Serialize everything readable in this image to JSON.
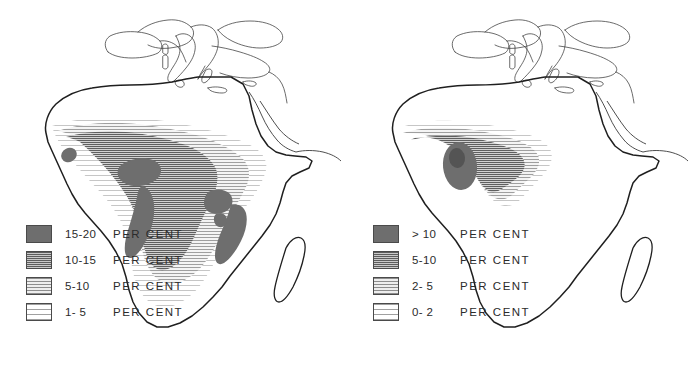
{
  "figure": {
    "type": "choropleth-map-pair",
    "region": "Africa",
    "unit_label": "PER CENT",
    "background_color": "#ffffff",
    "ink_color": "#2b2b2b"
  },
  "maps": [
    {
      "id": "left-map",
      "position": "left",
      "legend": {
        "classes": [
          {
            "range": "15-20",
            "unit": "PER CENT",
            "fill": "solid",
            "swatch_color": "#6e6e6e",
            "order": 1
          },
          {
            "range": "10-15",
            "unit": "PER CENT",
            "fill": "dense",
            "swatch_color": "#5d5d5d",
            "order": 2
          },
          {
            "range": "5-10",
            "unit": "PER CENT",
            "fill": "medium",
            "swatch_color": "#8d8d8d",
            "order": 3
          },
          {
            "range": "1- 5",
            "unit": "PER CENT",
            "fill": "sparse",
            "swatch_color": "#a0a0a0",
            "order": 4
          }
        ]
      },
      "shaded_regions": [
        "West Africa / Sahel belt",
        "Guinea coast dark core",
        "Nigeria-Cameroon coastal dark core",
        "Congo basin",
        "Angola coastal dark band",
        "Great Lakes / East Africa dark core",
        "Mozambique corridor"
      ],
      "unshaded_features": [
        "Sahara",
        "Southern Africa",
        "Horn of Africa",
        "Madagascar",
        "Southern Europe",
        "Arabia"
      ]
    },
    {
      "id": "right-map",
      "position": "right",
      "legend": {
        "classes": [
          {
            "range": "> 10",
            "unit": "PER CENT",
            "fill": "solid",
            "swatch_color": "#6e6e6e",
            "order": 1
          },
          {
            "range": "5-10",
            "unit": "PER CENT",
            "fill": "dense",
            "swatch_color": "#5d5d5d",
            "order": 2
          },
          {
            "range": "2- 5",
            "unit": "PER CENT",
            "fill": "medium",
            "swatch_color": "#8d8d8d",
            "order": 3
          },
          {
            "range": "0- 2",
            "unit": "PER CENT",
            "fill": "sparse",
            "swatch_color": "#a0a0a0",
            "order": 4
          }
        ]
      },
      "shaded_regions": [
        "West Africa / Sahel belt",
        "Ghana-Togo dark oval core",
        "Upper Volta light patch"
      ],
      "unshaded_features": [
        "Sahara",
        "Central Africa",
        "Southern Africa",
        "East Africa",
        "Madagascar",
        "Southern Europe",
        "Arabia"
      ]
    }
  ]
}
